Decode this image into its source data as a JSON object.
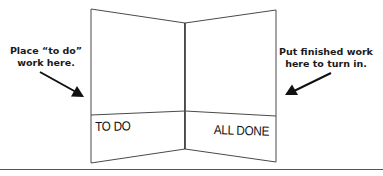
{
  "instructions": {
    "left": {
      "line1": "Place “to do”",
      "line2": "work here."
    },
    "right": {
      "line1": "Put finished work",
      "line2": "here to turn in."
    }
  },
  "folder": {
    "left_pocket_label": "TO DO",
    "right_pocket_label": "ALL DONE"
  },
  "colors": {
    "line": "#3a3a3a",
    "arrow": "#111111",
    "text": "#1a1a1a",
    "background": "#ffffff"
  }
}
